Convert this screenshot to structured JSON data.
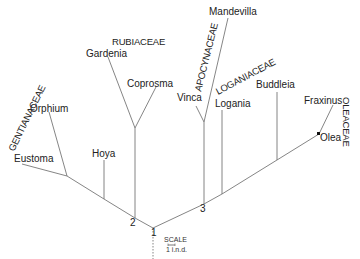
{
  "diagram": {
    "type": "phylogenetic-tree",
    "families": [
      {
        "id": "gentianaceae",
        "label": "GENTIANACEAE"
      },
      {
        "id": "rubiaceae",
        "label": "RUBIACEAE"
      },
      {
        "id": "apocynaceae",
        "label": "APOCYNACEAE"
      },
      {
        "id": "loganiaceae",
        "label": "LOGANIACEAE"
      },
      {
        "id": "oleaceae",
        "label": "OLEACEAE"
      }
    ],
    "taxa": [
      {
        "id": "eustoma",
        "label": "Eustoma",
        "family": "gentianaceae"
      },
      {
        "id": "orphium",
        "label": "Orphium",
        "family": "gentianaceae"
      },
      {
        "id": "hoya",
        "label": "Hoya"
      },
      {
        "id": "gardenia",
        "label": "Gardenia",
        "family": "rubiaceae"
      },
      {
        "id": "coprosma",
        "label": "Coprosma",
        "family": "rubiaceae"
      },
      {
        "id": "vinca",
        "label": "Vinca",
        "family": "apocynaceae"
      },
      {
        "id": "mandevilla",
        "label": "Mandevilla",
        "family": "apocynaceae"
      },
      {
        "id": "logania",
        "label": "Logania",
        "family": "loganiaceae"
      },
      {
        "id": "buddleia",
        "label": "Buddleia"
      },
      {
        "id": "fraxinus",
        "label": "Fraxinus",
        "family": "oleaceae"
      },
      {
        "id": "olea",
        "label": "Olea",
        "family": "oleaceae"
      }
    ],
    "nodes": [
      {
        "id": "n1",
        "label": "1"
      },
      {
        "id": "n2",
        "label": "2"
      },
      {
        "id": "n3",
        "label": "3"
      }
    ],
    "scale": {
      "title": "SCALE",
      "unit": "1 i.n.d."
    }
  }
}
